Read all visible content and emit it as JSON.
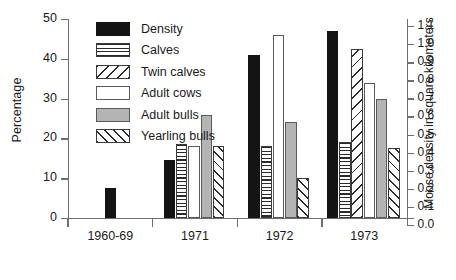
{
  "chart_data": {
    "type": "bar",
    "title": "",
    "subtitle": "",
    "xlabel": "",
    "ylabel": "Percentage",
    "ylabel_secondary": "Moose density in square kilometers",
    "categories": [
      "1960-69",
      "1971",
      "1972",
      "1973"
    ],
    "ylim": [
      0,
      50
    ],
    "ylim_secondary": [
      0.0,
      1.1
    ],
    "yticks": [
      0,
      10,
      20,
      30,
      40,
      50
    ],
    "yticks_secondary": [
      0.0,
      0.1,
      0.2,
      0.3,
      0.4,
      0.5,
      0.6,
      0.7,
      0.8,
      0.9,
      1.0,
      1.1
    ],
    "grid": false,
    "legend_position": "top-left-inside",
    "series": [
      {
        "name": "Density",
        "pattern": "solid-black",
        "axis": "secondary",
        "values": [
          7.5,
          14.5,
          41.0,
          47.0
        ]
      },
      {
        "name": "Calves",
        "pattern": "horizontal-lines",
        "axis": "primary",
        "values": [
          null,
          18.5,
          18.0,
          19.0
        ]
      },
      {
        "name": "Twin calves",
        "pattern": "diagonal-backslash",
        "axis": "primary",
        "values": [
          null,
          null,
          null,
          42.5
        ]
      },
      {
        "name": "Adult cows",
        "pattern": "white-empty",
        "axis": "primary",
        "values": [
          null,
          18.0,
          46.0,
          34.0
        ]
      },
      {
        "name": "Adult bulls",
        "pattern": "gray-fill",
        "axis": "primary",
        "values": [
          null,
          26.0,
          24.0,
          30.0
        ]
      },
      {
        "name": "Yearling bulls",
        "pattern": "diagonal-forward",
        "axis": "primary",
        "values": [
          null,
          18.0,
          10.0,
          17.5
        ]
      }
    ]
  },
  "axis_left": {
    "label": "Percentage",
    "tick_labels": [
      "0",
      "10",
      "20",
      "30",
      "40",
      "50"
    ]
  },
  "axis_right": {
    "label": "Moose density in square kilometers",
    "tick_labels": [
      "0.0",
      "0.1",
      "0.2",
      "0.3",
      "0.4",
      "0.5",
      "0.6",
      "0.7",
      "0.8",
      "0.9",
      "1.0",
      "1.1"
    ]
  },
  "axis_bottom": {
    "tick_labels": [
      "1960-69",
      "1971",
      "1972",
      "1973"
    ]
  },
  "legend": {
    "items": [
      {
        "label": "Density",
        "pattern": "solid-black"
      },
      {
        "label": "Calves",
        "pattern": "horizontal-lines"
      },
      {
        "label": "Twin calves",
        "pattern": "diagonal-backslash"
      },
      {
        "label": "Adult cows",
        "pattern": "white-empty"
      },
      {
        "label": "Adult bulls",
        "pattern": "gray-fill"
      },
      {
        "label": "Yearling bulls",
        "pattern": "diagonal-forward"
      }
    ]
  },
  "colors": {
    "density_fill": "#141414",
    "adult_bulls_fill": "#b4b4b4",
    "empty_fill": "#ffffff",
    "stroke": "#5a5a5a",
    "axis": "#6e6e6e",
    "text": "#1a1a1a",
    "background": "#ffffff"
  }
}
